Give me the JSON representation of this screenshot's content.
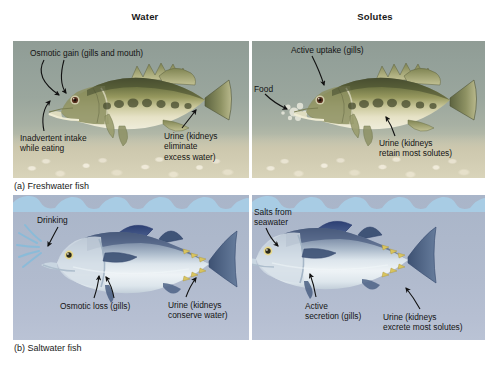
{
  "figure": {
    "headers": {
      "water": "Water",
      "solutes": "Solutes"
    },
    "captions": {
      "a": "(a) Freshwater fish",
      "b": "(b) Saltwater fish"
    },
    "panels": [
      {
        "id": "a-left",
        "caption_ref": "a",
        "column": "Water",
        "environment": "freshwater",
        "fish": "largemouth bass",
        "labels": [
          "Osmotic gain (gills and mouth)",
          "Inadvertent intake\nwhile eating",
          "Urine (kidneys\neliminate\nexcess water)"
        ]
      },
      {
        "id": "a-right",
        "caption_ref": "a",
        "column": "Solutes",
        "environment": "freshwater",
        "fish": "largemouth bass",
        "labels": [
          "Active uptake (gills)",
          "Food",
          "Urine (kidneys\nretain most solutes)"
        ]
      },
      {
        "id": "b-left",
        "caption_ref": "b",
        "column": "Water",
        "environment": "saltwater",
        "fish": "tuna",
        "labels": [
          "Drinking",
          "Osmotic loss (gills)",
          "Urine (kidneys\nconserve water)"
        ]
      },
      {
        "id": "b-right",
        "caption_ref": "b",
        "column": "Solutes",
        "environment": "saltwater",
        "fish": "tuna",
        "labels": [
          "Salts from\nseawater",
          "Active\nsecretion (gills)",
          "Urine (kidneys\nexcrete most solutes)"
        ]
      }
    ],
    "annotations": {
      "osmotic_gain": "Osmotic gain (gills and mouth)",
      "inadvertent_intake": "Inadvertent intake\nwhile eating",
      "urine_fw_water": "Urine (kidneys\neliminate\nexcess water)",
      "active_uptake": "Active uptake (gills)",
      "food": "Food",
      "urine_fw_solutes": "Urine (kidneys\nretain most solutes)",
      "drinking": "Drinking",
      "osmotic_loss": "Osmotic loss (gills)",
      "urine_sw_water": "Urine (kidneys\nconserve water)",
      "salts_from_seawater": "Salts from\nseawater",
      "active_secretion": "Active\nsecretion (gills)",
      "urine_sw_solutes": "Urine (kidneys\nexcrete most solutes)"
    },
    "colors": {
      "freshwater_water": "#9aa69d",
      "freshwater_gravel": "#d9d4ba",
      "saltwater_water": "#aeb9cd",
      "saltwater_wave": "#a8cce4",
      "page_background": "#ffffff",
      "text": "#141414",
      "arrow": "#111111"
    }
  }
}
